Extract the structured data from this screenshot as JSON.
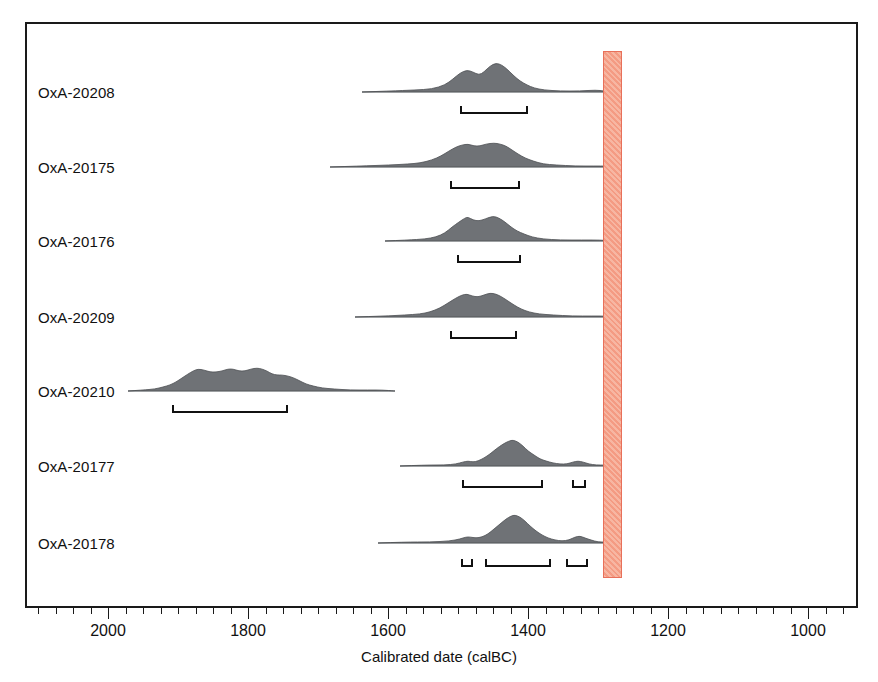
{
  "figure": {
    "axis_title": "Calibrated date (calBC)",
    "axis_min_year": 2080,
    "axis_max_year": 950,
    "px_per_year": 0.7,
    "x_at_2000": 108,
    "frame": {
      "left": 25,
      "top": 22,
      "width": 833,
      "height": 586
    },
    "colors": {
      "frame": "#1a1a1a",
      "distribution_fill": "#6f7276",
      "distribution_stroke": "#4b4e52",
      "baseline": "#a9b0b4",
      "bracket": "#111111",
      "band_border": "#e8705a",
      "band_fill": "#f5a58f",
      "text": "#111111"
    }
  },
  "highlight_band": {
    "name": "event-band",
    "start_year": 1293,
    "end_year": 1268,
    "x": 603,
    "width": 19,
    "top": 51,
    "height": 527
  },
  "x_axis": {
    "major_ticks": [
      {
        "year": 2000,
        "label": "2000",
        "x": 108
      },
      {
        "year": 1800,
        "label": "1800",
        "x": 248
      },
      {
        "year": 1600,
        "label": "1600",
        "x": 388
      },
      {
        "year": 1400,
        "label": "1400",
        "x": 528
      },
      {
        "year": 1200,
        "label": "1200",
        "x": 668
      },
      {
        "year": 1000,
        "label": "1000",
        "x": 808
      }
    ],
    "minor_tick_spacing_years": 25
  },
  "chart_data": {
    "type": "area",
    "title": "",
    "xlabel": "Calibrated date (calBC)",
    "ylabel": "",
    "xlim": [
      2080,
      950
    ],
    "x_reversed": true,
    "grid": false,
    "legend": "none",
    "series": [
      {
        "name": "OxA-20208",
        "label": "OxA-20208",
        "baseline_y": 92,
        "label_x": 38,
        "curve_start_x": 362,
        "curve_end_x": 612,
        "peaks_x": [
          467,
          496
        ],
        "peak_heights": [
          22,
          29
        ],
        "points": [
          [
            362,
            0
          ],
          [
            390,
            1
          ],
          [
            415,
            2
          ],
          [
            432,
            3
          ],
          [
            445,
            7
          ],
          [
            453,
            13
          ],
          [
            460,
            19
          ],
          [
            467,
            22
          ],
          [
            473,
            20
          ],
          [
            479,
            17
          ],
          [
            484,
            20
          ],
          [
            490,
            26
          ],
          [
            496,
            29
          ],
          [
            502,
            27
          ],
          [
            508,
            22
          ],
          [
            514,
            16
          ],
          [
            520,
            11
          ],
          [
            527,
            7
          ],
          [
            534,
            4
          ],
          [
            544,
            2
          ],
          [
            560,
            1
          ],
          [
            580,
            1
          ],
          [
            596,
            2
          ],
          [
            604,
            1
          ],
          [
            612,
            0
          ]
        ],
        "brackets": [
          {
            "x": 460,
            "width": 68,
            "y": 106
          }
        ]
      },
      {
        "name": "OxA-20175",
        "label": "OxA-20175",
        "baseline_y": 167,
        "label_x": 38,
        "curve_start_x": 330,
        "curve_end_x": 614,
        "peaks_x": [
          468,
          494
        ],
        "peak_heights": [
          23,
          24
        ],
        "points": [
          [
            330,
            0
          ],
          [
            360,
            1
          ],
          [
            390,
            2
          ],
          [
            408,
            3
          ],
          [
            420,
            4
          ],
          [
            432,
            7
          ],
          [
            441,
            11
          ],
          [
            449,
            16
          ],
          [
            456,
            20
          ],
          [
            462,
            22
          ],
          [
            468,
            23
          ],
          [
            474,
            21
          ],
          [
            480,
            21
          ],
          [
            486,
            23
          ],
          [
            494,
            24
          ],
          [
            500,
            23
          ],
          [
            506,
            21
          ],
          [
            512,
            17
          ],
          [
            518,
            13
          ],
          [
            525,
            9
          ],
          [
            533,
            6
          ],
          [
            543,
            3
          ],
          [
            556,
            2
          ],
          [
            575,
            1
          ],
          [
            595,
            1
          ],
          [
            606,
            1
          ],
          [
            614,
            0
          ]
        ],
        "brackets": [
          {
            "x": 450,
            "width": 70,
            "y": 181
          }
        ]
      },
      {
        "name": "OxA-20176",
        "label": "OxA-20176",
        "baseline_y": 241,
        "label_x": 38,
        "curve_start_x": 385,
        "curve_end_x": 615,
        "peaks_x": [
          468,
          493
        ],
        "peak_heights": [
          24,
          25
        ],
        "points": [
          [
            385,
            0
          ],
          [
            408,
            1
          ],
          [
            425,
            2
          ],
          [
            436,
            4
          ],
          [
            445,
            8
          ],
          [
            452,
            14
          ],
          [
            459,
            19
          ],
          [
            465,
            23
          ],
          [
            468,
            24
          ],
          [
            473,
            21
          ],
          [
            479,
            20
          ],
          [
            485,
            22
          ],
          [
            493,
            25
          ],
          [
            499,
            23
          ],
          [
            505,
            19
          ],
          [
            511,
            14
          ],
          [
            517,
            10
          ],
          [
            524,
            7
          ],
          [
            532,
            4
          ],
          [
            543,
            2
          ],
          [
            560,
            1
          ],
          [
            582,
            1
          ],
          [
            600,
            1
          ],
          [
            615,
            0
          ]
        ],
        "brackets": [
          {
            "x": 457,
            "width": 64,
            "y": 255
          }
        ]
      },
      {
        "name": "OxA-20209",
        "label": "OxA-20209",
        "baseline_y": 317,
        "label_x": 38,
        "curve_start_x": 355,
        "curve_end_x": 613,
        "peaks_x": [
          467,
          490
        ],
        "peak_heights": [
          23,
          24
        ],
        "points": [
          [
            355,
            0
          ],
          [
            385,
            1
          ],
          [
            405,
            2
          ],
          [
            420,
            3
          ],
          [
            430,
            5
          ],
          [
            440,
            9
          ],
          [
            448,
            14
          ],
          [
            456,
            19
          ],
          [
            462,
            22
          ],
          [
            467,
            23
          ],
          [
            472,
            21
          ],
          [
            478,
            20
          ],
          [
            484,
            22
          ],
          [
            490,
            24
          ],
          [
            496,
            23
          ],
          [
            502,
            20
          ],
          [
            508,
            16
          ],
          [
            514,
            12
          ],
          [
            521,
            8
          ],
          [
            529,
            5
          ],
          [
            539,
            3
          ],
          [
            553,
            2
          ],
          [
            572,
            1
          ],
          [
            593,
            1
          ],
          [
            605,
            1
          ],
          [
            613,
            0
          ]
        ],
        "brackets": [
          {
            "x": 450,
            "width": 67,
            "y": 331
          }
        ]
      },
      {
        "name": "OxA-20210",
        "label": "OxA-20210",
        "baseline_y": 391,
        "label_x": 38,
        "curve_start_x": 128,
        "curve_end_x": 395,
        "peaks_x": [
          198,
          233,
          257
        ],
        "peak_heights": [
          22,
          22,
          23
        ],
        "points": [
          [
            128,
            0
          ],
          [
            143,
            1
          ],
          [
            155,
            2
          ],
          [
            163,
            4
          ],
          [
            170,
            6
          ],
          [
            176,
            9
          ],
          [
            182,
            13
          ],
          [
            188,
            17
          ],
          [
            193,
            20
          ],
          [
            198,
            22
          ],
          [
            204,
            21
          ],
          [
            210,
            19
          ],
          [
            216,
            19
          ],
          [
            222,
            20
          ],
          [
            228,
            22
          ],
          [
            233,
            22
          ],
          [
            239,
            20
          ],
          [
            245,
            20
          ],
          [
            251,
            22
          ],
          [
            257,
            23
          ],
          [
            262,
            22
          ],
          [
            267,
            20
          ],
          [
            272,
            17
          ],
          [
            277,
            16
          ],
          [
            282,
            16
          ],
          [
            288,
            15
          ],
          [
            294,
            13
          ],
          [
            300,
            10
          ],
          [
            306,
            7
          ],
          [
            313,
            5
          ],
          [
            322,
            3
          ],
          [
            334,
            2
          ],
          [
            350,
            1
          ],
          [
            368,
            1
          ],
          [
            382,
            1
          ],
          [
            395,
            0
          ]
        ],
        "brackets": [
          {
            "x": 172,
            "width": 116,
            "y": 405
          }
        ]
      },
      {
        "name": "OxA-20177",
        "label": "OxA-20177",
        "baseline_y": 466,
        "label_x": 38,
        "curve_start_x": 400,
        "curve_end_x": 613,
        "peaks_x": [
          468,
          513,
          578
        ],
        "peak_heights": [
          5,
          26,
          5
        ],
        "points": [
          [
            400,
            0
          ],
          [
            425,
            1
          ],
          [
            445,
            1
          ],
          [
            456,
            2
          ],
          [
            463,
            4
          ],
          [
            468,
            5
          ],
          [
            473,
            4
          ],
          [
            478,
            5
          ],
          [
            484,
            8
          ],
          [
            490,
            12
          ],
          [
            496,
            17
          ],
          [
            503,
            22
          ],
          [
            509,
            25
          ],
          [
            513,
            26
          ],
          [
            518,
            24
          ],
          [
            523,
            20
          ],
          [
            528,
            15
          ],
          [
            534,
            11
          ],
          [
            540,
            7
          ],
          [
            546,
            5
          ],
          [
            553,
            3
          ],
          [
            560,
            2
          ],
          [
            567,
            2
          ],
          [
            573,
            4
          ],
          [
            578,
            5
          ],
          [
            583,
            4
          ],
          [
            589,
            2
          ],
          [
            596,
            1
          ],
          [
            605,
            1
          ],
          [
            613,
            0
          ]
        ],
        "brackets": [
          {
            "x": 462,
            "width": 81,
            "y": 480
          },
          {
            "x": 572,
            "width": 14,
            "y": 480
          }
        ]
      },
      {
        "name": "OxA-20178",
        "label": "OxA-20178",
        "baseline_y": 543,
        "label_x": 38,
        "curve_start_x": 378,
        "curve_end_x": 614,
        "peaks_x": [
          470,
          515,
          580
        ],
        "peak_heights": [
          6,
          28,
          7
        ],
        "points": [
          [
            378,
            0
          ],
          [
            405,
            1
          ],
          [
            430,
            1
          ],
          [
            450,
            2
          ],
          [
            460,
            4
          ],
          [
            466,
            6
          ],
          [
            470,
            6
          ],
          [
            476,
            5
          ],
          [
            482,
            6
          ],
          [
            488,
            9
          ],
          [
            494,
            14
          ],
          [
            500,
            19
          ],
          [
            506,
            24
          ],
          [
            511,
            27
          ],
          [
            515,
            28
          ],
          [
            520,
            26
          ],
          [
            525,
            22
          ],
          [
            530,
            17
          ],
          [
            536,
            12
          ],
          [
            542,
            8
          ],
          [
            548,
            5
          ],
          [
            555,
            3
          ],
          [
            562,
            2
          ],
          [
            569,
            3
          ],
          [
            575,
            6
          ],
          [
            580,
            7
          ],
          [
            585,
            5
          ],
          [
            591,
            3
          ],
          [
            598,
            1
          ],
          [
            606,
            1
          ],
          [
            614,
            0
          ]
        ],
        "brackets": [
          {
            "x": 461,
            "width": 12,
            "y": 559
          },
          {
            "x": 485,
            "width": 66,
            "y": 559
          },
          {
            "x": 566,
            "width": 22,
            "y": 559
          }
        ]
      }
    ]
  }
}
